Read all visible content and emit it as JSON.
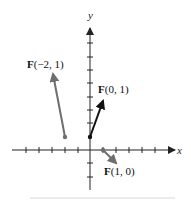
{
  "figure": {
    "x_axis_label": "x",
    "y_axis_label": "y",
    "vectors": [
      {
        "name": "F(-2,1)",
        "bold": "F",
        "rest": "(−2, 1)",
        "tail": [
          -2,
          1
        ],
        "color": "#6e6e6e"
      },
      {
        "name": "F(0,1)",
        "bold": "F",
        "rest": "(0, 1)",
        "tail": [
          0,
          1
        ],
        "color": "#111111"
      },
      {
        "name": "F(1,0)",
        "bold": "F",
        "rest": "(1, 0)",
        "tail": [
          1,
          0
        ],
        "color": "#6e6e6e"
      }
    ],
    "colors": {
      "axis": "#222222",
      "gray_vector": "#6e6e6e",
      "black_vector": "#111111"
    }
  }
}
